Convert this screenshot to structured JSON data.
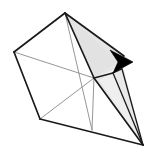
{
  "figure": {
    "width": 149,
    "height": 155,
    "background_color": "#ffffff",
    "colors": {
      "outline_dark": "#1a1a1a",
      "outline_light": "#8a8a8a",
      "shade_fill": "#e6e6e6",
      "shade_fill_light": "#efefef",
      "arrow_fill": "#000000",
      "background": "#ffffff"
    },
    "vertices": {
      "apex_top": [
        65,
        13
      ],
      "left": [
        14,
        52
      ],
      "bottom_left": [
        40,
        119
      ],
      "center_right": [
        94,
        78
      ],
      "bottom_center": [
        92,
        130
      ],
      "far_point": [
        143,
        145
      ],
      "arrow_tip": [
        133,
        62
      ],
      "arrow_upper": [
        110,
        50
      ],
      "arrow_lower": [
        113,
        73
      ],
      "arrow_notch": [
        118,
        62
      ]
    },
    "edges": [
      {
        "name": "apex-to-left",
        "from": "apex_top",
        "to": "left",
        "weight": "heavy"
      },
      {
        "name": "left-to-bottom-left",
        "from": "left",
        "to": "bottom_left",
        "weight": "heavy"
      },
      {
        "name": "bottom-left-to-far-point",
        "from": "bottom_left",
        "to": "far_point",
        "weight": "heavy"
      },
      {
        "name": "apex-to-center-right",
        "from": "apex_top",
        "to": "center_right",
        "weight": "heavy"
      },
      {
        "name": "left-to-center-right",
        "from": "left",
        "to": "center_right",
        "weight": "light"
      },
      {
        "name": "apex-to-bottom-center",
        "from": "apex_top",
        "to": "bottom_center",
        "weight": "light"
      },
      {
        "name": "bottom-left-to-center-right",
        "from": "bottom_left",
        "to": "center_right",
        "weight": "light"
      },
      {
        "name": "center-right-to-bottom-center",
        "from": "center_right",
        "to": "bottom_center",
        "weight": "light"
      },
      {
        "name": "center-right-to-far-point",
        "from": "center_right",
        "to": "far_point",
        "weight": "heavy"
      },
      {
        "name": "apex-to-far-point-upper",
        "from": "apex_top",
        "to": "far_point",
        "weight": "heavy"
      },
      {
        "name": "arrow-lower-to-far-point",
        "from": "arrow_lower",
        "to": "far_point",
        "weight": "medium"
      }
    ],
    "shaded_faces": [
      {
        "name": "upper-cone-face",
        "points": "65,13 133,62 94,78",
        "fill": "shade_fill"
      },
      {
        "name": "lower-cone-face",
        "points": "94,78 118,66 143,145",
        "fill": "shade_fill"
      },
      {
        "name": "lower-cone-face-2",
        "points": "113,73 124,72 143,145",
        "fill": "shade_fill_light"
      }
    ],
    "arrow": {
      "name": "direction-arrowhead",
      "points": "110,50 133,62 113,73 118,62",
      "fill": "arrow_fill",
      "direction": "right"
    }
  }
}
